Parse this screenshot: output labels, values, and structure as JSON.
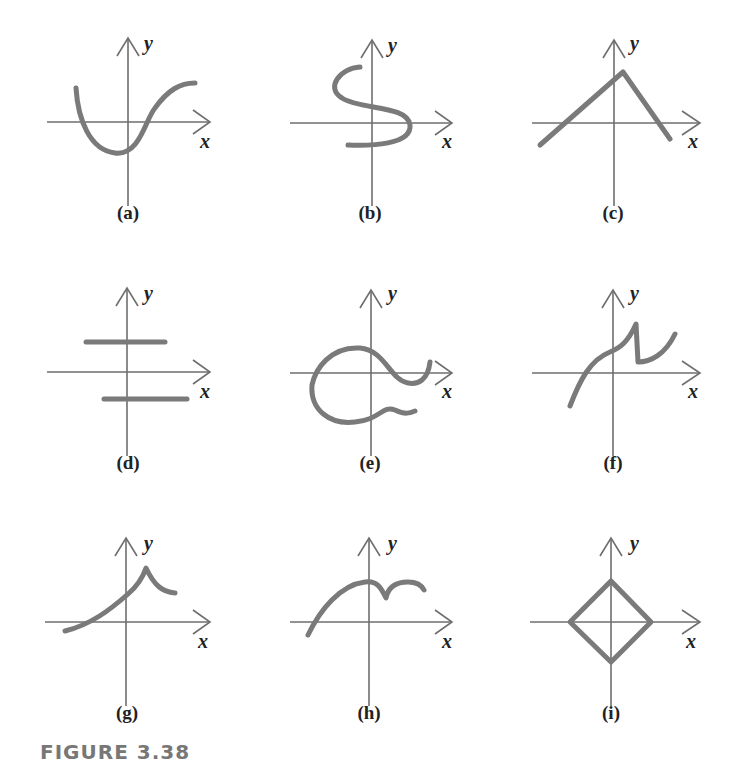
{
  "figure": {
    "label": "FIGURE 3.38",
    "axis_color": "#6e6e6e",
    "curve_color": "#7a7a7a",
    "x_axis_label": "x",
    "y_axis_label": "y",
    "panels": [
      {
        "id": "a",
        "caption": "(a)",
        "description": "Wave-like curve: starts high on left, dips below x-axis, rises to level off upper right"
      },
      {
        "id": "b",
        "caption": "(b)",
        "description": "S-shaped curve crossing the y-axis multiple times"
      },
      {
        "id": "c",
        "caption": "(c)",
        "description": "Inverted V: line rising from lower left to peak just right of y-axis, then falling below x-axis"
      },
      {
        "id": "d",
        "caption": "(d)",
        "description": "Two horizontal line segments, one above and one below the x-axis, both crossing the y-axis"
      },
      {
        "id": "e",
        "caption": "(e)",
        "description": "Looping curve that wraps around the origin and trails off with wavy tails to the right"
      },
      {
        "id": "f",
        "caption": "(f)",
        "description": "Increasing curve with a jump discontinuity (drop) right of the y-axis, then rising again"
      },
      {
        "id": "g",
        "caption": "(g)",
        "description": "Curve rising from lower left to a cusp peak right of the y-axis, then decreasing"
      },
      {
        "id": "h",
        "caption": "(h)",
        "description": "Arch curve with a cusp dip right of the y-axis followed by a smaller arch"
      },
      {
        "id": "i",
        "caption": "(i)",
        "description": "Diamond (square rotated 45°) centered at the origin"
      }
    ]
  }
}
